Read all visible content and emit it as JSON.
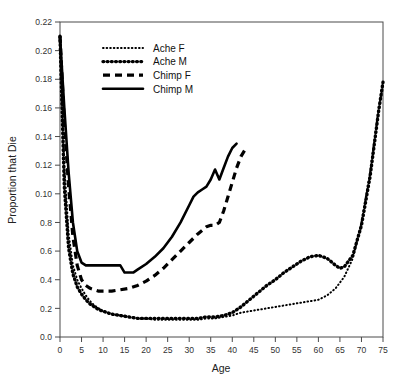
{
  "chart_data": {
    "type": "line",
    "title": "",
    "xlabel": "Age",
    "ylabel": "Proportion that Die",
    "xlim": [
      0,
      75
    ],
    "ylim": [
      0.0,
      0.22
    ],
    "grid": false,
    "legend_position": "top-left",
    "xticks": [
      0,
      5,
      10,
      15,
      20,
      25,
      30,
      35,
      40,
      45,
      50,
      55,
      60,
      65,
      70,
      75
    ],
    "xtick_labels": [
      "0",
      "5",
      "10",
      "15",
      "20",
      "25",
      "30",
      "35",
      "40",
      "45",
      "50",
      "55",
      "60",
      "65",
      "70",
      "75"
    ],
    "yticks": [
      0.0,
      0.02,
      0.04,
      0.06,
      0.08,
      0.1,
      0.12,
      0.14,
      0.16,
      0.18,
      0.2,
      0.22
    ],
    "ytick_labels": [
      "0.0",
      "0.2",
      "0.4",
      "0.6",
      "0.8",
      "0.10",
      "0.12",
      "0.14",
      "0.16",
      "0.18",
      "0.20",
      "0.22"
    ],
    "series": [
      {
        "name": "Ache F",
        "style": "fine-dotted",
        "color": "#000000",
        "x": [
          0,
          1,
          2,
          3,
          4,
          5,
          6,
          7,
          8,
          9,
          10,
          12,
          14,
          16,
          18,
          20,
          22,
          24,
          26,
          28,
          30,
          32,
          34,
          36,
          38,
          40,
          42,
          44,
          46,
          48,
          50,
          52,
          54,
          56,
          58,
          60,
          62,
          64,
          66,
          68,
          70,
          72,
          74,
          75
        ],
        "y": [
          0.21,
          0.12,
          0.072,
          0.05,
          0.04,
          0.034,
          0.029,
          0.025,
          0.022,
          0.02,
          0.018,
          0.016,
          0.015,
          0.014,
          0.013,
          0.013,
          0.012,
          0.012,
          0.012,
          0.012,
          0.012,
          0.012,
          0.013,
          0.013,
          0.014,
          0.015,
          0.017,
          0.018,
          0.019,
          0.02,
          0.021,
          0.022,
          0.023,
          0.024,
          0.025,
          0.026,
          0.029,
          0.034,
          0.042,
          0.055,
          0.08,
          0.115,
          0.16,
          0.176
        ]
      },
      {
        "name": "Ache M",
        "style": "thick-dotted",
        "color": "#000000",
        "x": [
          0,
          1,
          2,
          3,
          4,
          5,
          6,
          7,
          8,
          9,
          10,
          12,
          14,
          16,
          18,
          20,
          22,
          24,
          26,
          28,
          30,
          32,
          34,
          36,
          38,
          40,
          42,
          44,
          46,
          48,
          50,
          52,
          54,
          56,
          58,
          60,
          62,
          64,
          65,
          66,
          68,
          70,
          72,
          74,
          75
        ],
        "y": [
          0.21,
          0.105,
          0.062,
          0.044,
          0.035,
          0.03,
          0.026,
          0.023,
          0.021,
          0.019,
          0.018,
          0.016,
          0.015,
          0.014,
          0.013,
          0.013,
          0.013,
          0.013,
          0.013,
          0.013,
          0.013,
          0.013,
          0.014,
          0.014,
          0.015,
          0.017,
          0.021,
          0.026,
          0.031,
          0.036,
          0.04,
          0.045,
          0.049,
          0.053,
          0.056,
          0.057,
          0.055,
          0.05,
          0.048,
          0.049,
          0.057,
          0.078,
          0.112,
          0.158,
          0.178
        ]
      },
      {
        "name": "Chimp F",
        "style": "dashed",
        "color": "#000000",
        "x": [
          0,
          1,
          2,
          3,
          4,
          5,
          6,
          7,
          8,
          9,
          10,
          12,
          14,
          16,
          18,
          20,
          22,
          24,
          26,
          28,
          30,
          32,
          34,
          35,
          36,
          37,
          38,
          39,
          40,
          41,
          42,
          43
        ],
        "y": [
          0.21,
          0.15,
          0.105,
          0.07,
          0.05,
          0.04,
          0.036,
          0.034,
          0.033,
          0.032,
          0.032,
          0.032,
          0.033,
          0.034,
          0.036,
          0.039,
          0.043,
          0.048,
          0.054,
          0.06,
          0.066,
          0.072,
          0.077,
          0.078,
          0.078,
          0.08,
          0.088,
          0.098,
          0.108,
          0.118,
          0.126,
          0.131
        ]
      },
      {
        "name": "Chimp M",
        "style": "solid",
        "color": "#000000",
        "x": [
          0,
          1,
          2,
          3,
          4,
          5,
          6,
          7,
          8,
          9,
          10,
          12,
          14,
          15,
          16,
          17,
          18,
          20,
          22,
          24,
          26,
          28,
          30,
          31,
          32,
          33,
          34,
          35,
          36,
          37,
          38,
          39,
          40,
          41
        ],
        "y": [
          0.21,
          0.16,
          0.115,
          0.08,
          0.06,
          0.052,
          0.05,
          0.05,
          0.05,
          0.05,
          0.05,
          0.05,
          0.05,
          0.045,
          0.045,
          0.045,
          0.047,
          0.051,
          0.056,
          0.062,
          0.07,
          0.08,
          0.092,
          0.098,
          0.101,
          0.103,
          0.105,
          0.11,
          0.117,
          0.11,
          0.118,
          0.126,
          0.132,
          0.135
        ]
      }
    ]
  },
  "legend": {
    "items": [
      {
        "label": "Ache F"
      },
      {
        "label": "Ache M"
      },
      {
        "label": "Chimp F"
      },
      {
        "label": "Chimp M"
      }
    ]
  }
}
